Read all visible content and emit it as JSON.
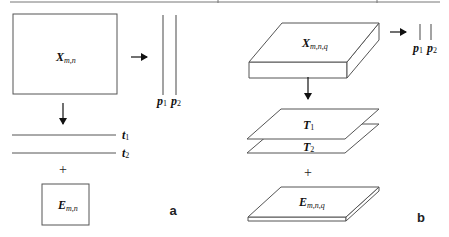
{
  "figure": {
    "panel_a": {
      "label": "a",
      "matrix": {
        "symbol": "X",
        "subscript": "m,n"
      },
      "loadings": [
        {
          "symbol": "p",
          "subscript": "1"
        },
        {
          "symbol": "p",
          "subscript": "2"
        }
      ],
      "scores": [
        {
          "symbol": "t",
          "subscript": "1"
        },
        {
          "symbol": "t",
          "subscript": "2"
        }
      ],
      "operator": "+",
      "residual": {
        "symbol": "E",
        "subscript": "m,n"
      }
    },
    "panel_b": {
      "label": "b",
      "tensor": {
        "symbol": "X",
        "subscript": "m,n,q"
      },
      "loadings": [
        {
          "symbol": "p",
          "subscript": "1"
        },
        {
          "symbol": "p",
          "subscript": "2"
        }
      ],
      "scores": [
        {
          "symbol": "T",
          "subscript": "1"
        },
        {
          "symbol": "T",
          "subscript": "2"
        }
      ],
      "operator": "+",
      "residual": {
        "symbol": "E",
        "subscript": "m,n,q"
      }
    }
  },
  "colors": {
    "stroke": "#555555",
    "text": "#111111",
    "background": "#ffffff"
  }
}
